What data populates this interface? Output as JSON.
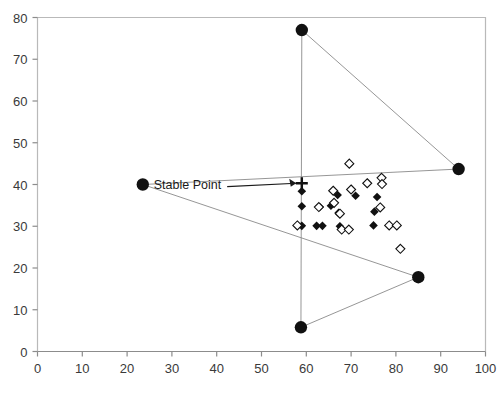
{
  "chart_data": {
    "type": "scatter",
    "title": "",
    "xlabel": "",
    "ylabel": "",
    "xlim": [
      0,
      100
    ],
    "ylim": [
      0,
      80
    ],
    "xticks": [
      0,
      10,
      20,
      30,
      40,
      50,
      60,
      70,
      80,
      90,
      100
    ],
    "yticks": [
      0,
      10,
      20,
      30,
      40,
      50,
      60,
      70,
      80
    ],
    "grid": false,
    "legend": "none",
    "series": [
      {
        "name": "Vertices",
        "marker": "filled-circle",
        "color": "#111111",
        "points": [
          {
            "x": 59.0,
            "y": 77.0
          },
          {
            "x": 23.5,
            "y": 40.0
          },
          {
            "x": 94.0,
            "y": 43.7
          },
          {
            "x": 85.0,
            "y": 17.8
          },
          {
            "x": 58.8,
            "y": 5.8
          }
        ]
      },
      {
        "name": "Stable Point",
        "marker": "cross",
        "color": "#111111",
        "points": [
          {
            "x": 59.0,
            "y": 40.3
          }
        ]
      },
      {
        "name": "Filled diamonds",
        "marker": "filled-diamond",
        "color": "#111111",
        "points": [
          {
            "x": 59.0,
            "y": 38.4
          },
          {
            "x": 59.0,
            "y": 34.8
          },
          {
            "x": 59.0,
            "y": 30.1
          },
          {
            "x": 62.3,
            "y": 30.1
          },
          {
            "x": 63.6,
            "y": 30.1
          },
          {
            "x": 63.0,
            "y": 34.6
          },
          {
            "x": 65.5,
            "y": 34.9
          },
          {
            "x": 67.2,
            "y": 33.2
          },
          {
            "x": 67.5,
            "y": 30.0
          },
          {
            "x": 67.0,
            "y": 37.5
          },
          {
            "x": 71.0,
            "y": 37.3
          },
          {
            "x": 75.8,
            "y": 37.0
          },
          {
            "x": 75.2,
            "y": 33.5
          },
          {
            "x": 75.0,
            "y": 30.2
          }
        ]
      },
      {
        "name": "Open diamonds",
        "marker": "open-diamond",
        "color": "#111111",
        "points": [
          {
            "x": 58.0,
            "y": 30.2
          },
          {
            "x": 62.8,
            "y": 34.6
          },
          {
            "x": 66.2,
            "y": 35.6
          },
          {
            "x": 67.5,
            "y": 33.0
          },
          {
            "x": 67.9,
            "y": 29.2
          },
          {
            "x": 69.5,
            "y": 29.2
          },
          {
            "x": 66.0,
            "y": 38.5
          },
          {
            "x": 69.6,
            "y": 45.0
          },
          {
            "x": 70.0,
            "y": 38.8
          },
          {
            "x": 73.6,
            "y": 40.3
          },
          {
            "x": 76.8,
            "y": 41.6
          },
          {
            "x": 76.9,
            "y": 40.1
          },
          {
            "x": 76.5,
            "y": 34.5
          },
          {
            "x": 78.5,
            "y": 30.2
          },
          {
            "x": 80.2,
            "y": 30.2
          },
          {
            "x": 81.0,
            "y": 24.6
          }
        ]
      }
    ],
    "polylines": [
      {
        "name": "polygon-outline",
        "color": "#8a8a8a",
        "points": [
          [
            59.0,
            77.0
          ],
          [
            94.0,
            43.7
          ],
          [
            23.5,
            40.0
          ],
          [
            85.0,
            17.8
          ],
          [
            58.8,
            5.8
          ],
          [
            59.0,
            77.0
          ]
        ]
      }
    ],
    "annotations": [
      {
        "text": "Stable Point",
        "x": 41.0,
        "y": 39.0,
        "arrow_to": {
          "x": 58.2,
          "y": 40.3
        }
      }
    ]
  }
}
